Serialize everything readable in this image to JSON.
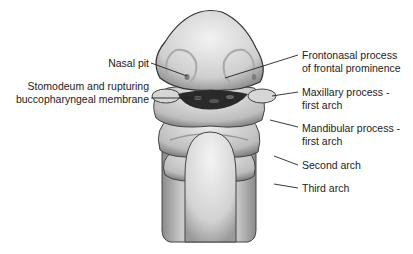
{
  "diagram": {
    "labels_left": [
      {
        "id": "nasal_pit",
        "lines": [
          "Nasal pit"
        ]
      },
      {
        "id": "stomodeum",
        "lines": [
          "Stomodeum and rupturing",
          "buccopharyngeal membrane"
        ]
      }
    ],
    "labels_right": [
      {
        "id": "frontonasal",
        "lines": [
          "Frontonasal process",
          "of frontal prominence"
        ]
      },
      {
        "id": "maxillary",
        "lines": [
          "Maxillary process -",
          "first arch"
        ]
      },
      {
        "id": "mandibular",
        "lines": [
          "Mandibular process -",
          "first arch"
        ]
      },
      {
        "id": "second_arch",
        "lines": [
          "Second arch"
        ]
      },
      {
        "id": "third_arch",
        "lines": [
          "Third arch"
        ]
      }
    ],
    "colors": {
      "text": "#222222",
      "tissue_light": "#e6e6e6",
      "tissue_dark": "#9a9a9a",
      "outline": "#333333",
      "cavity": "#2a2a2a"
    }
  }
}
